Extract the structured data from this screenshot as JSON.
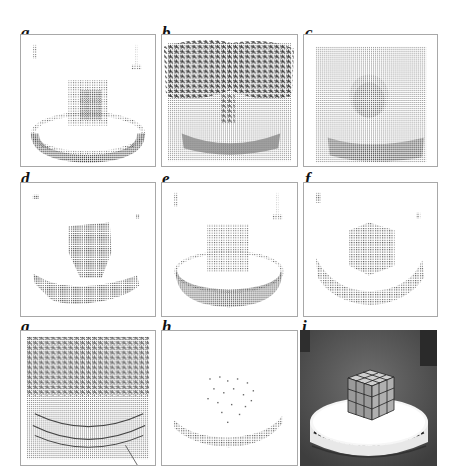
{
  "figure": {
    "panels": [
      {
        "id": "a",
        "label": "a",
        "content": "sparse vector field of cube on turntable"
      },
      {
        "id": "b",
        "label": "b",
        "content": "dense noisy vector field, noise at top"
      },
      {
        "id": "c",
        "label": "c",
        "content": "dense uniform vector field, faint cube"
      },
      {
        "id": "d",
        "label": "d",
        "content": "sparse thresholded field, coarse blobs"
      },
      {
        "id": "e",
        "label": "e",
        "content": "sparse vector field of cube and turntable"
      },
      {
        "id": "f",
        "label": "f",
        "content": "sparse field with cube and turntable rim"
      },
      {
        "id": "g",
        "label": "g",
        "content": "dense noisy vector field with flow lines"
      },
      {
        "id": "h",
        "label": "h",
        "content": "very sparse field, turntable rim arc"
      },
      {
        "id": "i",
        "label": "i",
        "content": "photograph of Rubik's cube on a white turntable"
      }
    ]
  },
  "colors": {
    "border": "#a8a8a8",
    "dot": "#555555",
    "dark_dot": "#222222",
    "photo_bg": "#5c5c5c"
  }
}
